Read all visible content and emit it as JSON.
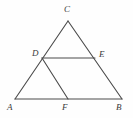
{
  "figure": {
    "kind": "plane-geometry-diagram",
    "shape_name": "triangle",
    "background_color": "#fefefe",
    "stroke_color": "#4a4a4a",
    "stroke_width": 1.1,
    "label_color": "#3a3a3a",
    "points": {
      "A": {
        "label": "A",
        "x": 15,
        "y": 99
      },
      "B": {
        "label": "B",
        "x": 122,
        "y": 99
      },
      "C": {
        "label": "C",
        "x": 68,
        "y": 21
      },
      "D": {
        "label": "D",
        "x": 42,
        "y": 58
      },
      "E": {
        "label": "E",
        "x": 95,
        "y": 58
      },
      "F": {
        "label": "F",
        "x": 68,
        "y": 99
      }
    },
    "segments": [
      {
        "name": "AC",
        "from": "A",
        "to": "C"
      },
      {
        "name": "CB",
        "from": "C",
        "to": "B"
      },
      {
        "name": "AB",
        "from": "A",
        "to": "B"
      },
      {
        "name": "DE",
        "from": "D",
        "to": "E"
      },
      {
        "name": "DF",
        "from": "D",
        "to": "F"
      }
    ]
  }
}
